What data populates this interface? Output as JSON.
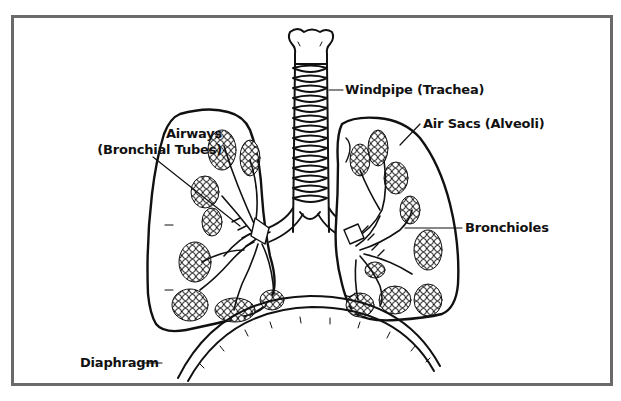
{
  "diagram": {
    "frame_color": "#6a6a6a",
    "line_color": "#111111",
    "labels": {
      "windpipe": "Windpipe (Trachea)",
      "airways_line1": "Airways",
      "airways_line2": "(Bronchial Tubes)",
      "air_sacs": "Air Sacs (Alveoli)",
      "bronchioles": "Bronchioles",
      "diaphragm": "Diaphragm"
    }
  }
}
